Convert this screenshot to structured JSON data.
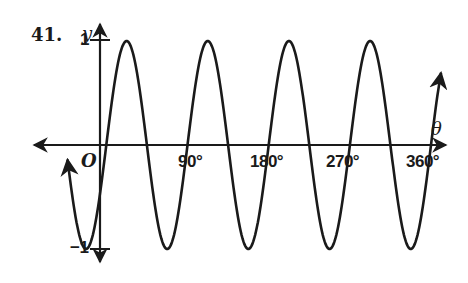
{
  "problem": {
    "number": "41."
  },
  "chart_data": {
    "type": "line",
    "title": "",
    "xlabel": "θ",
    "ylabel": "y",
    "x_tick_labels": [
      "90°",
      "180°",
      "270°",
      "360°"
    ],
    "x_ticks_deg": [
      90,
      180,
      270,
      360
    ],
    "y_tick_labels": [
      "1",
      "-1"
    ],
    "y_ticks": [
      1,
      -1
    ],
    "origin_label": "O",
    "xlim_deg": [
      -35,
      380
    ],
    "ylim": [
      -1,
      1
    ],
    "grid": false,
    "series": [
      {
        "name": "curve",
        "description": "sinusoid, amplitude 1, period 90°, arrows at both ends",
        "amplitude": 1,
        "period_deg": 90,
        "zero_crossings_up_deg": [
          7,
          97,
          187,
          277,
          367
        ],
        "maxima_deg": [
          30,
          120,
          210,
          300
        ],
        "minima_deg": [
          -15,
          75,
          165,
          255,
          345
        ]
      }
    ]
  },
  "labels": {
    "y_axis": "y",
    "x_axis": "θ",
    "origin": "O",
    "y_max": "1",
    "y_min": "−1",
    "x90": "90°",
    "x180": "180°",
    "x270": "270°",
    "x360": "360°"
  }
}
